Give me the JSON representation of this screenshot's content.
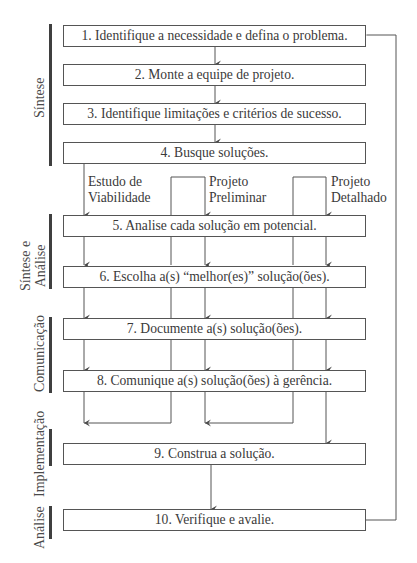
{
  "steps": [
    {
      "id": 1,
      "label": "1. Identifique a necessidade e defina o problema."
    },
    {
      "id": 2,
      "label": "2. Monte a equipe de projeto."
    },
    {
      "id": 3,
      "label": "3. Identifique limitações e critérios de sucesso."
    },
    {
      "id": 4,
      "label": "4. Busque soluções."
    },
    {
      "id": 5,
      "label": "5. Analise cada solução em potencial."
    },
    {
      "id": 6,
      "label": "6. Escolha a(s) “melhor(es)” solução(ões)."
    },
    {
      "id": 7,
      "label": "7. Documente a(s) solução(ões)."
    },
    {
      "id": 8,
      "label": "8. Comunique a(s) solução(ões) à gerência."
    },
    {
      "id": 9,
      "label": "9. Construa a solução."
    },
    {
      "id": 10,
      "label": "10. Verifique e avalie."
    }
  ],
  "paths": [
    {
      "line1": "Estudo de",
      "line2": "Viabilidade"
    },
    {
      "line1": "Projeto",
      "line2": "Preliminar"
    },
    {
      "line1": "Projeto",
      "line2": "Detalhado"
    }
  ],
  "phases": [
    {
      "label": "Síntese"
    },
    {
      "line1": "Síntese e",
      "line2": "Análise"
    },
    {
      "label": "Comunicação"
    },
    {
      "label": "Implementação"
    },
    {
      "label": "Análise"
    }
  ],
  "colors": {
    "line": "#555555",
    "bar": "#3f3f3f",
    "text": "#3a3a3a"
  }
}
